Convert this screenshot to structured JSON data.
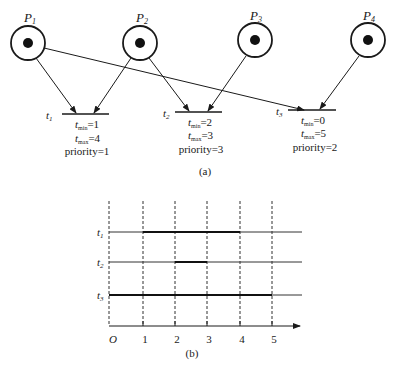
{
  "figure_a": {
    "caption": "(a)",
    "places": [
      {
        "id": "P1",
        "label_main": "P",
        "label_sub": "1",
        "tokens": 1
      },
      {
        "id": "P2",
        "label_main": "P",
        "label_sub": "2",
        "tokens": 1
      },
      {
        "id": "P3",
        "label_main": "P",
        "label_sub": "3",
        "tokens": 1
      },
      {
        "id": "P4",
        "label_main": "P",
        "label_sub": "4",
        "tokens": 1
      }
    ],
    "transitions": [
      {
        "id": "t1",
        "label_main": "t",
        "label_sub": "1",
        "tmin_label": "t",
        "tmin_sub": "min",
        "tmin_value": "=1",
        "tmax_label": "t",
        "tmax_sub": "max",
        "tmax_value": "=4",
        "priority": "priority=1"
      },
      {
        "id": "t2",
        "label_main": "t",
        "label_sub": "2",
        "tmin_label": "t",
        "tmin_sub": "min",
        "tmin_value": "=2",
        "tmax_label": "t",
        "tmax_sub": "max",
        "tmax_value": "=3",
        "priority": "priority=3"
      },
      {
        "id": "t3",
        "label_main": "t",
        "label_sub": "3",
        "tmin_label": "t",
        "tmin_sub": "min",
        "tmin_value": "=0",
        "tmax_label": "t",
        "tmax_sub": "max",
        "tmax_value": "=5",
        "priority": "priority=2"
      }
    ],
    "arcs": [
      {
        "from": "P1",
        "to": "t1"
      },
      {
        "from": "P2",
        "to": "t1"
      },
      {
        "from": "P2",
        "to": "t2"
      },
      {
        "from": "P3",
        "to": "t2"
      },
      {
        "from": "P1",
        "to": "t3"
      },
      {
        "from": "P4",
        "to": "t3"
      }
    ]
  },
  "figure_b": {
    "caption": "(b)",
    "origin_label": "O",
    "x_ticks": [
      "1",
      "2",
      "3",
      "4",
      "5"
    ],
    "rows": [
      {
        "label_main": "t",
        "label_sub": "1",
        "interval": [
          1,
          4
        ]
      },
      {
        "label_main": "t",
        "label_sub": "2",
        "interval": [
          2,
          3
        ]
      },
      {
        "label_main": "t",
        "label_sub": "3",
        "interval": [
          0,
          5
        ]
      }
    ]
  }
}
